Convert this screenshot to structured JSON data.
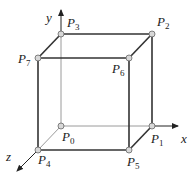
{
  "diagram": {
    "type": "cube-coordinate-system",
    "axes": [
      {
        "name": "x",
        "label": "x",
        "from": [
          152,
          126
        ],
        "to": [
          178,
          126
        ],
        "label_pos": [
          181,
          143
        ]
      },
      {
        "name": "y",
        "label": "y",
        "from": [
          61,
          34
        ],
        "to": [
          61,
          10
        ],
        "label_pos": [
          46,
          22
        ]
      },
      {
        "name": "z",
        "label": "z",
        "from": [
          38,
          150
        ],
        "to": [
          17,
          171
        ],
        "label_pos": [
          6,
          161
        ]
      }
    ],
    "vertices": [
      {
        "id": "P0",
        "main": "P",
        "sub": "0",
        "pos": [
          61,
          126
        ],
        "label_pos": [
          62,
          141
        ]
      },
      {
        "id": "P1",
        "main": "P",
        "sub": "1",
        "pos": [
          152,
          126
        ],
        "label_pos": [
          151,
          143
        ]
      },
      {
        "id": "P2",
        "main": "P",
        "sub": "2",
        "pos": [
          152,
          34
        ],
        "label_pos": [
          157,
          26
        ]
      },
      {
        "id": "P3",
        "main": "P",
        "sub": "3",
        "pos": [
          61,
          34
        ],
        "label_pos": [
          67,
          27
        ]
      },
      {
        "id": "P4",
        "main": "P",
        "sub": "4",
        "pos": [
          38,
          150
        ],
        "label_pos": [
          38,
          164
        ]
      },
      {
        "id": "P5",
        "main": "P",
        "sub": "5",
        "pos": [
          129,
          150
        ],
        "label_pos": [
          127,
          166
        ]
      },
      {
        "id": "P6",
        "main": "P",
        "sub": "6",
        "pos": [
          129,
          58
        ],
        "label_pos": [
          112,
          73
        ]
      },
      {
        "id": "P7",
        "main": "P",
        "sub": "7",
        "pos": [
          38,
          58
        ],
        "label_pos": [
          18,
          63
        ]
      }
    ],
    "edges_visible": [
      [
        "P4",
        "P5"
      ],
      [
        "P5",
        "P6"
      ],
      [
        "P6",
        "P7"
      ],
      [
        "P7",
        "P4"
      ],
      [
        "P3",
        "P2"
      ],
      [
        "P2",
        "P1"
      ],
      [
        "P7",
        "P3"
      ],
      [
        "P6",
        "P2"
      ],
      [
        "P5",
        "P1"
      ]
    ],
    "edges_hidden": [
      [
        "P0",
        "P1"
      ],
      [
        "P0",
        "P3"
      ],
      [
        "P0",
        "P4"
      ]
    ],
    "colors": {
      "visible_edge": "#333333",
      "hidden_edge": "#9a9a9a",
      "vertex_fill": "#d8d8d8",
      "vertex_stroke": "#666666",
      "axis": "#222222"
    }
  }
}
